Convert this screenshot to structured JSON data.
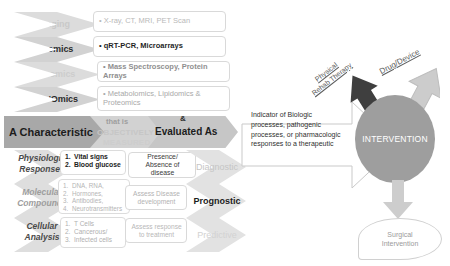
{
  "diagram": {
    "colors": {
      "chevron_light": "#d6d6d6",
      "chevron_mid": "#c3c3c3",
      "banner_dark": "#a6a6a6",
      "banner_light": "#cfcfcf",
      "circle": "#9b9b9b",
      "arrow_dark": "#3f3f3f",
      "arrow_light": "#c9c9c9",
      "text_dark": "#2b2b2b",
      "text_faded": "#b7b7b7",
      "text_white": "#ffffff"
    }
  },
  "modalities": [
    {
      "label": "Imaging",
      "faded": true
    },
    {
      "label": "Genomics",
      "faded": false
    },
    {
      "label": "Proteomics",
      "faded": true
    },
    {
      "label": "Other 'Omics",
      "faded": false
    }
  ],
  "modality_examples": [
    {
      "text": "X-ray, CT, MRI, PET Scan",
      "faded": true
    },
    {
      "text": "qRT-PCR, Microarrays",
      "faded": false
    },
    {
      "text": "Mass Spectroscopy, Protein Arrays",
      "faded": true
    },
    {
      "text": "Metabolomics, Lipidomics & Proteomics",
      "faded": true
    }
  ],
  "banner": {
    "characteristic": "A Characteristic",
    "that_is": "that is",
    "objectively": "OBJECTIVELY",
    "measured": "MEASURED",
    "ampersand": "&",
    "evaluated_as": "Evaluated As"
  },
  "analysis_levels": [
    {
      "line1": "Physiologic",
      "line2": "Responses"
    },
    {
      "line1": "Molecular",
      "line2": "Compounds"
    },
    {
      "line1": "Cellular",
      "line2": "Analysis"
    }
  ],
  "analysis_items": [
    {
      "faded": false,
      "items": [
        {
          "n": "1.",
          "text": "Vital signs"
        },
        {
          "n": "2.",
          "text": "Blood glucose"
        }
      ]
    },
    {
      "faded": true,
      "items": [
        {
          "n": "1.",
          "text": "DNA, RNA,"
        },
        {
          "n": "2.",
          "text": "Hormones,"
        },
        {
          "n": "3.",
          "text": "Antibodies,"
        },
        {
          "n": "4.",
          "text": "Neurotransmitters"
        }
      ]
    },
    {
      "faded": true,
      "items": [
        {
          "n": "1.",
          "text": "T Cells"
        },
        {
          "n": "2.",
          "text": "Cancerous/"
        },
        {
          "n": "3.",
          "text": "Infected cells"
        }
      ]
    }
  ],
  "outcomes": [
    {
      "line1": "Presence/",
      "line2": "Absence of disease",
      "faded": false
    },
    {
      "line1": "Assess Disease",
      "line2": "development",
      "faded": true
    },
    {
      "line1": "Assess response",
      "line2": "to treatment",
      "faded": true
    }
  ],
  "classifications": [
    {
      "label": "Diagnostic",
      "faded": true
    },
    {
      "label": "Prognostic",
      "faded": false
    },
    {
      "label": "Predictive",
      "faded": true
    }
  ],
  "indicator": {
    "line1": "Indicator of Biologic",
    "line2": "processes, pathogenic",
    "line3": "processes, or pharmacologic",
    "line4": "responses to a therapeutic"
  },
  "intervention": {
    "center_label": "INTERVENTION",
    "physical_rehab_line1": "Physical",
    "physical_rehab_line2": "Rehab Therapy",
    "drug_device": "Drug/Device",
    "surgical_line1": "Surgical",
    "surgical_line2": "Intervention"
  }
}
